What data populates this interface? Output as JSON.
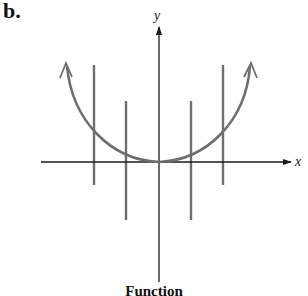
{
  "figure": {
    "panel_label": "b.",
    "caption": "Function",
    "x_axis_label": "x",
    "y_axis_label": "y",
    "curve_color": "#6e6e6e",
    "line_color": "#6e6e6e",
    "axis_color": "#1a1a1a"
  },
  "diagram": {
    "axes": {
      "x": {
        "from": [
          41,
          162
        ],
        "to": [
          290,
          162
        ],
        "arrow": "right"
      },
      "y": {
        "from": [
          159,
          282
        ],
        "to": [
          159,
          28
        ],
        "arrow": "up"
      }
    },
    "curve": {
      "type": "parabola",
      "vertex": [
        159,
        162
      ],
      "left_end": [
        66,
        64
      ],
      "right_end": [
        251,
        64
      ],
      "arrows": "both ends"
    },
    "vertical_lines": [
      {
        "x": 94,
        "y1": 65,
        "y2": 185
      },
      {
        "x": 126,
        "y1": 101,
        "y2": 220
      },
      {
        "x": 191,
        "y1": 101,
        "y2": 220
      },
      {
        "x": 223,
        "y1": 65,
        "y2": 185
      }
    ]
  }
}
